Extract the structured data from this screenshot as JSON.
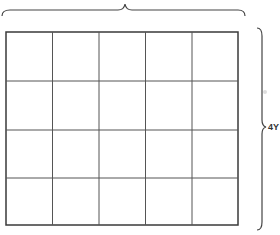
{
  "diagram": {
    "grid": {
      "columns": 5,
      "rows": 4,
      "x": 6,
      "y": 32,
      "width": 232,
      "height": 193,
      "line_color": "#3a3a3a"
    },
    "top_brace": {
      "label": ""
    },
    "right_brace": {
      "label": "4Y"
    }
  }
}
